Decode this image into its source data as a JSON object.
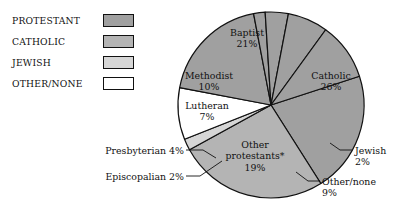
{
  "legend": {
    "items": [
      {
        "label": "PROTESTANT",
        "color": "#a0a0a0",
        "swatch_name": "swatch-protestant"
      },
      {
        "label": "CATHOLIC",
        "color": "#b4b4b4",
        "swatch_name": "swatch-catholic"
      },
      {
        "label": "JEWISH",
        "color": "#d6d6d6",
        "swatch_name": "swatch-jewish"
      },
      {
        "label": "OTHER/NONE",
        "color": "#ffffff",
        "swatch_name": "swatch-other-none"
      }
    ]
  },
  "labels": {
    "baptist": "Baptist\n21%",
    "baptist_name": "Baptist",
    "baptist_pct": "21%",
    "catholic_name": "Catholic",
    "catholic_pct": "26%",
    "methodist_name": "Methodist",
    "methodist_pct": "10%",
    "lutheran_name": "Lutheran",
    "lutheran_pct": "7%",
    "other_protestants_name": "Other",
    "other_protestants_name2": "protestants*",
    "other_protestants_pct": "19%",
    "presbyterian": "Presbyterian 4%",
    "episcopalian": "Episcopalian 2%",
    "jewish_name": "Jewish",
    "jewish_pct": "2%",
    "other_none_name": "Other/none",
    "other_none_pct": "9%"
  },
  "chart_data": {
    "type": "pie",
    "title": "",
    "subtitle": "",
    "xlabel": "",
    "ylabel": "",
    "legend_position": "left",
    "grid": false,
    "units": "percent",
    "total": 100,
    "note": "* Other protestants",
    "groups": [
      {
        "name": "PROTESTANT",
        "value": 63,
        "color": "#a0a0a0"
      },
      {
        "name": "CATHOLIC",
        "value": 26,
        "color": "#b4b4b4"
      },
      {
        "name": "JEWISH",
        "value": 2,
        "color": "#d6d6d6"
      },
      {
        "name": "OTHER/NONE",
        "value": 9,
        "color": "#ffffff"
      }
    ],
    "slices": [
      {
        "label": "Baptist",
        "value": 21,
        "group": "PROTESTANT",
        "color": "#a0a0a0"
      },
      {
        "label": "Catholic",
        "value": 26,
        "group": "CATHOLIC",
        "color": "#b4b4b4"
      },
      {
        "label": "Jewish",
        "value": 2,
        "group": "JEWISH",
        "color": "#d6d6d6"
      },
      {
        "label": "Other/none",
        "value": 9,
        "group": "OTHER/NONE",
        "color": "#ffffff"
      },
      {
        "label": "Other protestants*",
        "value": 19,
        "group": "PROTESTANT",
        "color": "#a0a0a0"
      },
      {
        "label": "Episcopalian",
        "value": 2,
        "group": "PROTESTANT",
        "color": "#a0a0a0"
      },
      {
        "label": "Presbyterian",
        "value": 4,
        "group": "PROTESTANT",
        "color": "#a0a0a0"
      },
      {
        "label": "Lutheran",
        "value": 7,
        "group": "PROTESTANT",
        "color": "#a0a0a0"
      },
      {
        "label": "Methodist",
        "value": 10,
        "group": "PROTESTANT",
        "color": "#a0a0a0"
      }
    ],
    "categories": [
      "Baptist",
      "Catholic",
      "Jewish",
      "Other/none",
      "Other protestants*",
      "Episcopalian",
      "Presbyterian",
      "Lutheran",
      "Methodist"
    ],
    "values": [
      21,
      26,
      2,
      9,
      19,
      2,
      4,
      7,
      10
    ]
  },
  "geometry": {
    "cx": 271,
    "cy": 105,
    "r": 93,
    "start_angle_deg": -18
  }
}
